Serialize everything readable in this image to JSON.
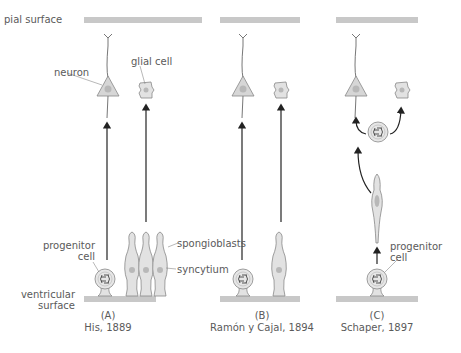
{
  "labels": {
    "pial_surface": "pial surface",
    "ventricular_surface_1": "ventricular",
    "ventricular_surface_2": "surface",
    "neuron": "neuron",
    "glial_cell": "glial cell",
    "progenitor_a_1": "progenitor",
    "progenitor_a_2": "cell",
    "spongioblasts": "spongioblasts",
    "syncytium": "syncytium",
    "progenitor_c_1": "progenitor",
    "progenitor_c_2": "cell"
  },
  "panels": [
    {
      "letter": "(A)",
      "caption": "His, 1889"
    },
    {
      "letter": "(B)",
      "caption": "Ramón y Cajal, 1894"
    },
    {
      "letter": "(C)",
      "caption": "Schaper, 1897"
    }
  ],
  "colors": {
    "surface_bar": "#c8c8c8",
    "cell_fill": "#e2e2e2",
    "nucleus": "#b8b8b8",
    "outline": "#888888",
    "arrow": "#222222"
  }
}
